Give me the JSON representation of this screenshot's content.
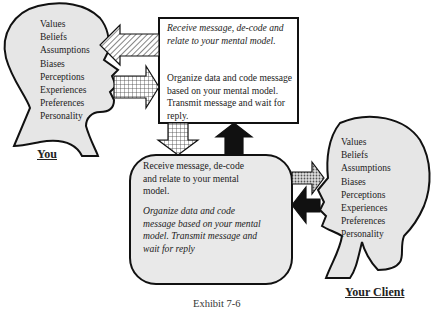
{
  "diagram": {
    "caption": "Exhibit 7-6",
    "you": {
      "label": "You",
      "traits": [
        "Values",
        "Beliefs",
        "Assumptions",
        "Biases",
        "Perceptions",
        "Experiences",
        "Preferences",
        "Personality"
      ]
    },
    "client": {
      "label": "Your Client",
      "traits": [
        "Values",
        "Beliefs",
        "Assumptions",
        "Biases",
        "Perceptions",
        "Experiences",
        "Preferences",
        "Personality"
      ]
    },
    "top_box": {
      "receive_text": "Receive message, de-code and relate to your mental model.",
      "organize_text": "Organize data  and code message based on your mental model.  Transmit message and wait for reply."
    },
    "bottom_box": {
      "receive_text": "Receive message, de-code  and relate to your mental model.",
      "organize_text": "Organize data  and code message based on your mental model.  Transmit message and wait for reply"
    },
    "arrows": [
      {
        "id": "top-box-to-you",
        "direction": "left",
        "pattern": "diagonal-hatch"
      },
      {
        "id": "you-to-top-box",
        "direction": "right",
        "pattern": "grid"
      },
      {
        "id": "top-box-to-bottom-box",
        "direction": "down",
        "pattern": "grid"
      },
      {
        "id": "bottom-box-to-top-box",
        "direction": "up",
        "pattern": "black"
      },
      {
        "id": "bottom-box-to-client",
        "direction": "right",
        "pattern": "dots"
      },
      {
        "id": "client-to-bottom-box",
        "direction": "left",
        "pattern": "black"
      }
    ],
    "colors": {
      "head_fill": "#e6e6e6",
      "box_fill": "#ffffff",
      "rounded_box_fill": "#e9e9e9",
      "stroke": "#111111"
    }
  }
}
